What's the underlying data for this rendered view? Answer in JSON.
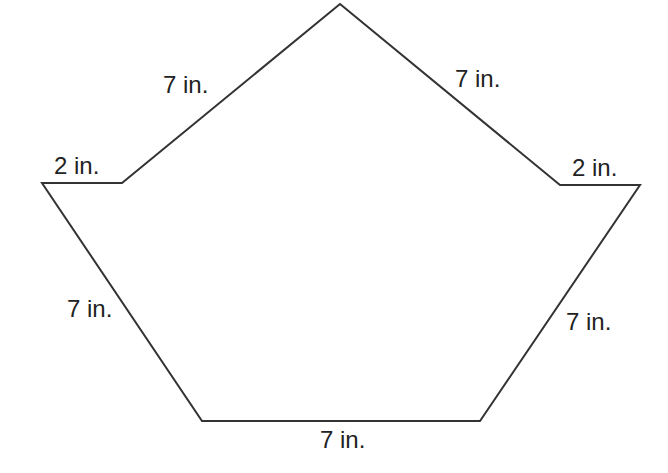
{
  "diagram": {
    "type": "polygon",
    "stroke_color": "#333333",
    "fill_color": "#ffffff",
    "vertices": [
      {
        "x": 340,
        "y": 4
      },
      {
        "x": 560,
        "y": 185
      },
      {
        "x": 640,
        "y": 185
      },
      {
        "x": 480,
        "y": 421
      },
      {
        "x": 202,
        "y": 421
      },
      {
        "x": 42,
        "y": 183
      },
      {
        "x": 122,
        "y": 183
      }
    ],
    "labels": {
      "top_left_edge": "7 in.",
      "top_right_edge": "7 in.",
      "left_stub": "2 in.",
      "right_stub": "2 in.",
      "lower_left_edge": "7 in.",
      "lower_right_edge": "7 in.",
      "bottom_edge": "7 in."
    }
  }
}
